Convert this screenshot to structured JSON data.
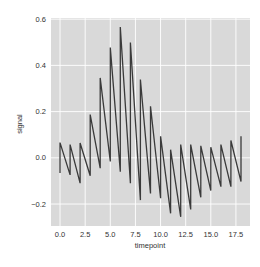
{
  "chart_data": {
    "type": "line",
    "title": "",
    "xlabel": "timepoint",
    "ylabel": "signal",
    "xlim": [
      -0.9,
      18.9
    ],
    "ylim": [
      -0.295,
      0.605
    ],
    "xticks": [
      0.0,
      2.5,
      5.0,
      7.5,
      10.0,
      12.5,
      15.0,
      17.5
    ],
    "xtick_labels": [
      "0.0",
      "2.5",
      "5.0",
      "7.5",
      "10.0",
      "12.5",
      "15.0",
      "17.5"
    ],
    "yticks": [
      -0.2,
      0.0,
      0.2,
      0.4,
      0.6
    ],
    "ytick_labels": [
      "−0.2",
      "0.0",
      "0.2",
      "0.4",
      "0.6"
    ],
    "grid": true,
    "legend": null,
    "style": {
      "background": "#eaeaf2",
      "plot_face": "#d9d9d9",
      "grid_color": "#ffffff",
      "line_color": "#3a3a3a"
    },
    "series": [
      {
        "name": "signal",
        "note": "unaggregated line; two observations per timepoint, drawn low then high",
        "x": [
          0,
          0,
          1,
          1,
          2,
          2,
          3,
          3,
          4,
          4,
          5,
          5,
          6,
          6,
          7,
          7,
          8,
          8,
          9,
          9,
          10,
          10,
          11,
          11,
          12,
          12,
          13,
          13,
          14,
          14,
          15,
          15,
          16,
          16,
          17,
          17,
          18,
          18
        ],
        "values": [
          -0.066,
          0.066,
          -0.074,
          0.057,
          -0.11,
          0.064,
          -0.078,
          0.187,
          -0.045,
          0.346,
          -0.016,
          0.477,
          -0.06,
          0.566,
          -0.11,
          0.499,
          -0.183,
          0.339,
          -0.154,
          0.223,
          -0.175,
          0.093,
          -0.24,
          0.035,
          -0.255,
          0.057,
          -0.223,
          0.057,
          -0.171,
          0.052,
          -0.142,
          0.046,
          -0.125,
          0.057,
          -0.125,
          0.075,
          -0.103,
          0.093
        ]
      }
    ]
  }
}
